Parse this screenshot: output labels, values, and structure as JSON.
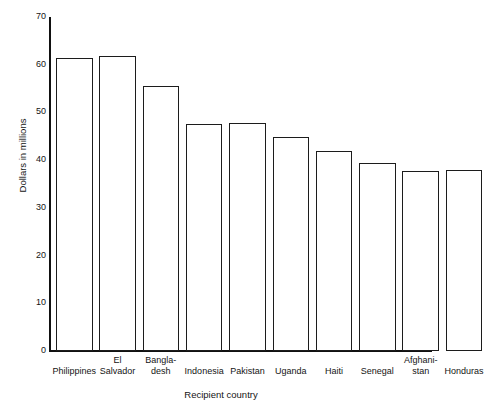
{
  "figure": {
    "faint_header": "",
    "ylabel": "Dollars in millions",
    "xlabel": "Recipient country"
  },
  "chart_data": {
    "type": "bar",
    "title": "",
    "subtitle": "",
    "xlabel": "Recipient country",
    "ylabel": "Dollars in millions",
    "ylim": [
      0,
      70
    ],
    "ytick_values": [
      0,
      10,
      20,
      30,
      40,
      50,
      60,
      70
    ],
    "ytick_labels": [
      "0",
      "10",
      "20",
      "30",
      "40",
      "50",
      "60",
      "70"
    ],
    "grid": false,
    "legend": null,
    "bar_color": "#ffffff",
    "bar_edge_color": "#1c1c1c",
    "axis_color": "#111111",
    "categories": [
      "Philippines",
      "El Salvador",
      "Bangladesh",
      "Indonesia",
      "Pakistan",
      "Uganda",
      "Haiti",
      "Senegal",
      "Afghanistan",
      "Honduras"
    ],
    "category_label_lines": [
      [
        "Philippines"
      ],
      [
        "El",
        "Salvador"
      ],
      [
        "Bangla-",
        "desh"
      ],
      [
        "Indonesia"
      ],
      [
        "Pakistan"
      ],
      [
        "Uganda"
      ],
      [
        "Haiti"
      ],
      [
        "Senegal"
      ],
      [
        "Afghani-",
        "stan"
      ],
      [
        "Honduras"
      ]
    ],
    "values": [
      61.5,
      61.8,
      55.5,
      47.5,
      47.7,
      44.8,
      42.0,
      39.5,
      37.8,
      38.0
    ]
  }
}
